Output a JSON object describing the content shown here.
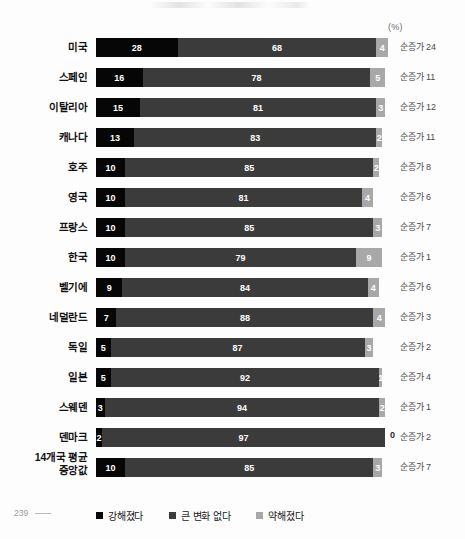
{
  "page": {
    "page_number": "239"
  },
  "unit_label": "(%)",
  "legend": {
    "items": [
      {
        "label": "강해졌다",
        "color": "#060606",
        "swatch_class": "sw-strong"
      },
      {
        "label": "큰 변화 없다",
        "color": "#3b3b3b",
        "swatch_class": "sw-nochange"
      },
      {
        "label": "약해졌다",
        "color": "#a8a8a8",
        "swatch_class": "sw-weak"
      }
    ]
  },
  "chart_data": {
    "type": "bar",
    "orientation": "horizontal",
    "stacked": true,
    "title": "",
    "xlabel": "(%)",
    "ylabel": "",
    "xlim": [
      0,
      100
    ],
    "grid": false,
    "legend_position": "bottom",
    "categories": [
      "미국",
      "스페인",
      "이탈리아",
      "캐나다",
      "호주",
      "영국",
      "프랑스",
      "한국",
      "벨기에",
      "네덜란드",
      "독일",
      "일본",
      "스웨덴",
      "덴마크",
      "14개국 평균 중앙값"
    ],
    "series": [
      {
        "name": "강해졌다",
        "color": "#060606",
        "values": [
          28,
          16,
          15,
          13,
          10,
          10,
          10,
          10,
          9,
          7,
          5,
          5,
          3,
          2,
          10
        ]
      },
      {
        "name": "큰 변화 없다",
        "color": "#3b3b3b",
        "values": [
          68,
          78,
          81,
          83,
          85,
          81,
          85,
          79,
          84,
          88,
          87,
          92,
          94,
          97,
          85
        ]
      },
      {
        "name": "약해졌다",
        "color": "#a8a8a8",
        "values": [
          4,
          5,
          3,
          2,
          2,
          4,
          3,
          9,
          4,
          4,
          3,
          1,
          2,
          0,
          3
        ]
      }
    ],
    "annotations": {
      "label_prefix": "순증가",
      "values": [
        24,
        11,
        12,
        11,
        8,
        6,
        7,
        1,
        6,
        3,
        2,
        4,
        1,
        2,
        7
      ]
    }
  },
  "rows": [
    {
      "label": "미국",
      "label_lines": [
        "미국"
      ],
      "strong": "28",
      "nochange": "68",
      "weak": "4",
      "net": "순증가 24"
    },
    {
      "label": "스페인",
      "label_lines": [
        "스페인"
      ],
      "strong": "16",
      "nochange": "78",
      "weak": "5",
      "net": "순증가 11"
    },
    {
      "label": "이탈리아",
      "label_lines": [
        "이탈리아"
      ],
      "strong": "15",
      "nochange": "81",
      "weak": "3",
      "net": "순증가 12"
    },
    {
      "label": "캐나다",
      "label_lines": [
        "캐나다"
      ],
      "strong": "13",
      "nochange": "83",
      "weak": "2",
      "net": "순증가 11"
    },
    {
      "label": "호주",
      "label_lines": [
        "호주"
      ],
      "strong": "10",
      "nochange": "85",
      "weak": "2",
      "net": "순증가 8"
    },
    {
      "label": "영국",
      "label_lines": [
        "영국"
      ],
      "strong": "10",
      "nochange": "81",
      "weak": "4",
      "net": "순증가 6"
    },
    {
      "label": "프랑스",
      "label_lines": [
        "프랑스"
      ],
      "strong": "10",
      "nochange": "85",
      "weak": "3",
      "net": "순증가 7"
    },
    {
      "label": "한국",
      "label_lines": [
        "한국"
      ],
      "strong": "10",
      "nochange": "79",
      "weak": "9",
      "net": "순증가 1"
    },
    {
      "label": "벨기에",
      "label_lines": [
        "벨기에"
      ],
      "strong": "9",
      "nochange": "84",
      "weak": "4",
      "net": "순증가 6"
    },
    {
      "label": "네덜란드",
      "label_lines": [
        "네덜란드"
      ],
      "strong": "7",
      "nochange": "88",
      "weak": "4",
      "net": "순증가 3"
    },
    {
      "label": "독일",
      "label_lines": [
        "독일"
      ],
      "strong": "5",
      "nochange": "87",
      "weak": "3",
      "net": "순증가 2"
    },
    {
      "label": "일본",
      "label_lines": [
        "일본"
      ],
      "strong": "5",
      "nochange": "92",
      "weak": "1",
      "net": "순증가 4"
    },
    {
      "label": "스웨덴",
      "label_lines": [
        "스웨덴"
      ],
      "strong": "3",
      "nochange": "94",
      "weak": "2",
      "net": "순증가 1"
    },
    {
      "label": "덴마크",
      "label_lines": [
        "덴마크"
      ],
      "strong": "2",
      "nochange": "97",
      "weak": "0",
      "net": "순증가 2"
    },
    {
      "label": "14개국 평균 중앙값",
      "label_lines": [
        "14개국 평균",
        "중앙값"
      ],
      "strong": "10",
      "nochange": "85",
      "weak": "3",
      "net": "순증가 7"
    }
  ]
}
